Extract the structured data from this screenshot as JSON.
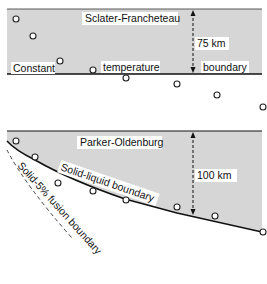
{
  "colors": {
    "panel_fill": "#d6d6d6",
    "line": "#111111",
    "label_bg": "#ffffff"
  },
  "top_panel": {
    "title": "Sclater-Francheteau",
    "thickness_label": "75 km",
    "boundary_words": [
      "Constant",
      "temperature",
      "boundary"
    ]
  },
  "bottom_panel": {
    "title": "Parker-Oldenburg",
    "thickness_label": "100 km",
    "curve_label": "Solid-liquid boundary",
    "dashed_curve_label": "Solid-5% fusion boundary"
  },
  "data_points": {
    "top": [
      [
        16,
        19
      ],
      [
        33,
        36
      ],
      [
        60,
        61
      ],
      [
        93,
        70
      ],
      [
        126,
        78
      ],
      [
        177,
        84
      ],
      [
        217,
        95
      ],
      [
        263,
        107
      ]
    ],
    "bottom": [
      [
        16,
        141
      ],
      [
        35,
        157
      ],
      [
        58,
        183
      ],
      [
        93,
        191
      ],
      [
        126,
        200
      ],
      [
        177,
        207
      ],
      [
        215,
        216
      ],
      [
        263,
        232
      ]
    ]
  }
}
